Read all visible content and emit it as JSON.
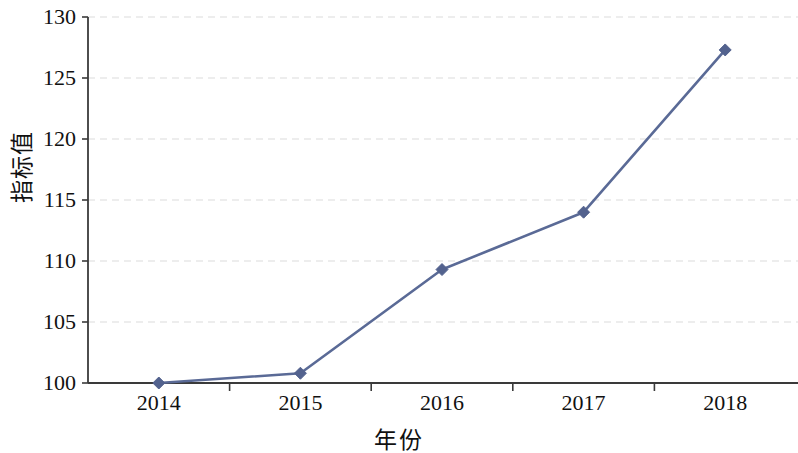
{
  "chart_data": {
    "type": "line",
    "title": "",
    "xlabel": "年份",
    "ylabel": "指标值",
    "categories": [
      "2014",
      "2015",
      "2016",
      "2017",
      "2018"
    ],
    "values": [
      100.0,
      100.8,
      109.3,
      114.0,
      127.3
    ],
    "series": [
      {
        "name": "指标值",
        "values": [
          100.0,
          100.8,
          109.3,
          114.0,
          127.3
        ]
      }
    ],
    "ylim": [
      100,
      130
    ],
    "yticks": [
      100,
      105,
      110,
      115,
      120,
      125,
      130
    ],
    "ytick_labels": [
      "100",
      "105",
      "110",
      "115",
      "120",
      "125",
      "130"
    ],
    "xtick_labels": [
      "2014",
      "2015",
      "2016",
      "2017",
      "2018"
    ],
    "grid": "horizontal-dashed",
    "legend": "none",
    "marker": "diamond",
    "line_color": "#5a6a96",
    "marker_color": "#53628e",
    "grid_color": "#e8e8e8",
    "axis_color": "#3a3a3a",
    "background": "#ffffff"
  }
}
